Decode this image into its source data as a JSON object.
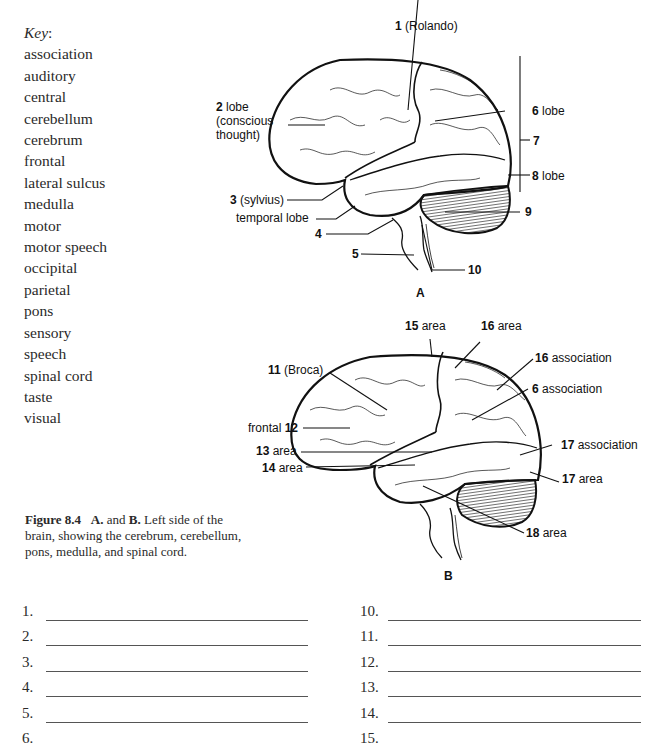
{
  "key": {
    "title": "Key",
    "colon": ":",
    "items": [
      "association",
      "auditory",
      "central",
      "cerebellum",
      "cerebrum",
      "frontal",
      "lateral sulcus",
      "medulla",
      "motor",
      "motor speech",
      "occipital",
      "parietal",
      "pons",
      "sensory",
      "speech",
      "spinal cord",
      "taste",
      "visual"
    ]
  },
  "figure": {
    "caption_label": "Figure 8.4",
    "caption_a": "A.",
    "caption_and": " and ",
    "caption_b": "B.",
    "caption_text": " Left side of the brain, showing the cerebrum, cerebellum, pons, medulla, and spinal cord.",
    "panel_a": {
      "title": "A",
      "labels": {
        "l1_num": "1",
        "l1_text": " (Rolando)",
        "l2_num": "2",
        "l2_text1": " lobe",
        "l2_text2": "(conscious",
        "l2_text3": "thought)",
        "l3_num": "3",
        "l3_text": " (sylvius)",
        "temporal": "temporal lobe",
        "l4_num": "4",
        "l5_num": "5",
        "l6_num": "6",
        "l6_text": " lobe",
        "l7_num": "7",
        "l8_num": "8",
        "l8_text": " lobe",
        "l9_num": "9",
        "l10_num": "10"
      }
    },
    "panel_b": {
      "title": "B",
      "labels": {
        "l11_num": "11",
        "l11_text": " (Broca)",
        "l12_pre": "frontal ",
        "l12_num": "12",
        "l13_num": "13",
        "l13_text": " area",
        "l14_num": "14",
        "l14_text": " area",
        "l15_num": "15",
        "l15_text": " area",
        "l16a_num": "16",
        "l16a_text": "  area",
        "l16b_num": "16",
        "l16b_text": " association",
        "l6_num": "6",
        "l6_text": " association",
        "l17a_num": "17",
        "l17a_text": " association",
        "l17b_num": "17",
        "l17b_text": " area",
        "l18_num": "18",
        "l18_text": " area"
      }
    }
  },
  "answers": {
    "left": [
      "1.",
      "2.",
      "3.",
      "4.",
      "5.",
      "6."
    ],
    "right": [
      "10.",
      "11.",
      "12.",
      "13.",
      "14.",
      "15."
    ]
  }
}
